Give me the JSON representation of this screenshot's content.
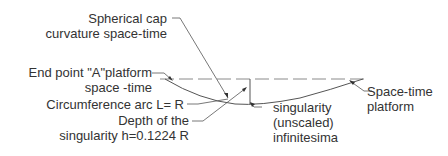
{
  "diagram": {
    "labels": {
      "spherical_cap_line1": "Spherical cap",
      "spherical_cap_line2": "curvature space-time",
      "end_point_line1": "End point \"A\"platform",
      "end_point_line2": "space -time",
      "circumference_arc": "Circumference arc  L= R",
      "depth_line1": "Depth of the",
      "depth_line2": "singularity h=0.1224 R",
      "singularity_line1": "singularity",
      "singularity_line2": "(unscaled)",
      "singularity_line3": "infinitesima",
      "platform_line1": "Space-time",
      "platform_line2": "platform"
    },
    "colors": {
      "line": "#555555",
      "dashed_line": "#8a8a8a",
      "text": "#333333",
      "background": "#ffffff"
    }
  }
}
